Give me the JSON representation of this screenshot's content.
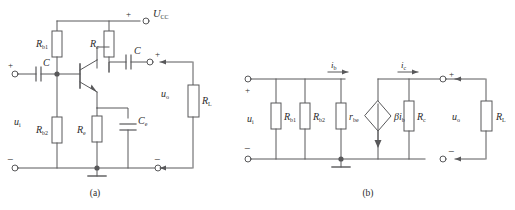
{
  "figure": {
    "caption_a": "(a)",
    "caption_b": "(b)"
  },
  "circuit_a": {
    "name": "common-emitter-amplifier",
    "supply": {
      "label": "U",
      "sub": "CC",
      "polarity": "+"
    },
    "components": [
      {
        "id": "rb1",
        "type": "resistor",
        "label": "R",
        "sub": "b1"
      },
      {
        "id": "rc",
        "type": "resistor",
        "label": "R",
        "sub": "c"
      },
      {
        "id": "rb2",
        "type": "resistor",
        "label": "R",
        "sub": "b2"
      },
      {
        "id": "re",
        "type": "resistor",
        "label": "R",
        "sub": "e"
      },
      {
        "id": "rl",
        "type": "resistor",
        "label": "R",
        "sub": "L"
      },
      {
        "id": "c_in",
        "type": "capacitor",
        "label": "C",
        "sub": ""
      },
      {
        "id": "c_out",
        "type": "capacitor",
        "label": "C",
        "sub": ""
      },
      {
        "id": "ce",
        "type": "capacitor",
        "label": "C",
        "sub": "e"
      },
      {
        "id": "q1",
        "type": "transistor-npn",
        "label": "",
        "sub": ""
      }
    ],
    "input": {
      "label": "u",
      "sub": "i",
      "plus": "+",
      "minus": "−"
    },
    "output": {
      "label": "u",
      "sub": "o",
      "plus": "+",
      "minus": "−"
    }
  },
  "circuit_b": {
    "name": "small-signal-equivalent-circuit",
    "components": [
      {
        "id": "rb1",
        "type": "resistor",
        "label": "R",
        "sub": "b1"
      },
      {
        "id": "rb2",
        "type": "resistor",
        "label": "R",
        "sub": "b2"
      },
      {
        "id": "rbe",
        "type": "resistor",
        "label": "r",
        "sub": "be"
      },
      {
        "id": "rc",
        "type": "resistor",
        "label": "R",
        "sub": "c"
      },
      {
        "id": "rl",
        "type": "resistor",
        "label": "R",
        "sub": "L"
      },
      {
        "id": "src",
        "type": "dependent-current-source",
        "label": "βi",
        "sub": "b"
      }
    ],
    "currents": [
      {
        "id": "ib",
        "label": "i",
        "sub": "b",
        "direction": "right"
      },
      {
        "id": "ic",
        "label": "i",
        "sub": "c",
        "direction": "right"
      }
    ],
    "input": {
      "label": "u",
      "sub": "i",
      "plus": "+",
      "minus": "−"
    },
    "output": {
      "label": "u",
      "sub": "o",
      "plus": "+",
      "minus": "−"
    }
  },
  "style": {
    "line": "#58585a",
    "text": "#2b2b2b",
    "bg": "#ffffff"
  }
}
